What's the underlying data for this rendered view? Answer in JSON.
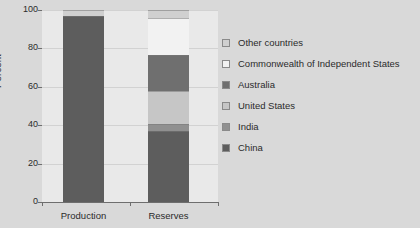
{
  "chart_data": {
    "type": "bar",
    "title": "",
    "subtitle": "",
    "xlabel": "",
    "ylabel": "Percent",
    "ylim": [
      0,
      100
    ],
    "yticks": [
      0,
      20,
      40,
      60,
      80,
      100
    ],
    "ytick_labels": [
      "0",
      "20",
      "40",
      "60",
      "80",
      "100"
    ],
    "categories": [
      "Production",
      "Reserves"
    ],
    "grid": true,
    "stacked": true,
    "legend_position": "right",
    "series": [
      {
        "name": "China",
        "color": "#5d5d5d",
        "values": [
          96.8,
          37.0
        ]
      },
      {
        "name": "India",
        "color": "#909090",
        "values": [
          0.0,
          3.6
        ]
      },
      {
        "name": "United States",
        "color": "#c6c6c6",
        "values": [
          0.0,
          17.2
        ]
      },
      {
        "name": "Australia",
        "color": "#6f6f6f",
        "values": [
          0.0,
          18.8
        ]
      },
      {
        "name": "Commonwealth of Independent States",
        "color": "#f2f2f2",
        "values": [
          0.0,
          19.2
        ]
      },
      {
        "name": "Other countries",
        "color": "#d0d0d0",
        "values": [
          3.2,
          4.2
        ]
      }
    ]
  },
  "legend": {
    "items": [
      {
        "label": "Other countries",
        "color": "#d0d0d0"
      },
      {
        "label": "Commonwealth of Independent States",
        "color": "#f2f2f2"
      },
      {
        "label": "Australia",
        "color": "#6f6f6f"
      },
      {
        "label": "United States",
        "color": "#c6c6c6"
      },
      {
        "label": "India",
        "color": "#909090"
      },
      {
        "label": "China",
        "color": "#5d5d5d"
      }
    ]
  },
  "colors": {
    "background": "#d9d9d9",
    "plot_background": "#e9e9e9",
    "axis": "#6e6e6e",
    "gridline": "#d2d2d2",
    "text": "#2b2b2b"
  }
}
